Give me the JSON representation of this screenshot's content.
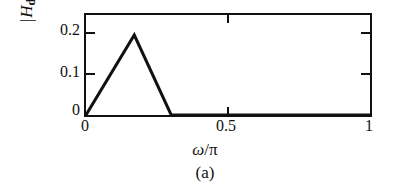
{
  "figure": {
    "caption": "(a)",
    "background_color": "#ffffff",
    "line_color": "#111111"
  },
  "axes": {
    "ylabel_bar_open": "|",
    "ylabel_symbol": "H",
    "ylabel_subscript": "d",
    "ylabel_paren_open": "(",
    "ylabel_omega": "ω",
    "ylabel_paren_close": ")",
    "ylabel_bar_close": "|",
    "xlabel_omega": "ω",
    "xlabel_slash": "/",
    "xlabel_pi": "π",
    "ytick_0": "0",
    "ytick_1": "0.1",
    "ytick_2": "0.2",
    "xtick_0": "0",
    "xtick_1": "0.5",
    "xtick_2": "1"
  },
  "chart_data": {
    "type": "line",
    "title": "",
    "subtitle": "(a)",
    "xlabel": "ω/π",
    "ylabel": "|H_d(ω)|",
    "xlim": [
      0,
      1
    ],
    "ylim": [
      0,
      0.25
    ],
    "xticks": [
      0,
      0.5,
      1
    ],
    "xticklabels": [
      "0",
      "0.5",
      "1"
    ],
    "yticks": [
      0,
      0.1,
      0.2
    ],
    "yticklabels": [
      "0",
      "0.1",
      "0.2"
    ],
    "grid": false,
    "legend": null,
    "series": [
      {
        "name": "|Hd(ω)|",
        "x": [
          0.0,
          0.17,
          0.3,
          1.0
        ],
        "y": [
          0.0,
          0.2,
          0.0,
          0.0
        ]
      }
    ],
    "annotations": [
      {
        "text": "triangular passband peaking at ω/π ≈ 0.17 with magnitude 0.2, zero elsewhere"
      }
    ]
  }
}
